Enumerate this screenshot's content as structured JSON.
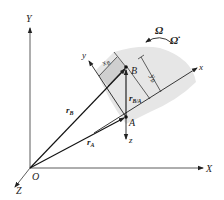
{
  "diagram": {
    "title": "",
    "global_axes": {
      "Y": "Y",
      "X": "X",
      "Z": "Z",
      "origin": "O"
    },
    "local_axes": {
      "x": "x",
      "y": "y",
      "z": "z"
    },
    "points": {
      "A": "A",
      "B": "B"
    },
    "vectors": {
      "r_B": "r",
      "r_B_sub": "B",
      "r_A": "r",
      "r_A_sub": "A",
      "r_BA": "r",
      "r_BA_sub": "B/A"
    },
    "dimensions": {
      "x_B": "x",
      "x_B_sub": "B",
      "y_B": "y",
      "y_B_sub": "B"
    },
    "rotation": {
      "omega": "Ω",
      "omega_dot": "Ω̇"
    },
    "colors": {
      "line": "#222222",
      "body_fill": "#e4e4e4",
      "strip_fill": "#d0d0d0"
    }
  }
}
